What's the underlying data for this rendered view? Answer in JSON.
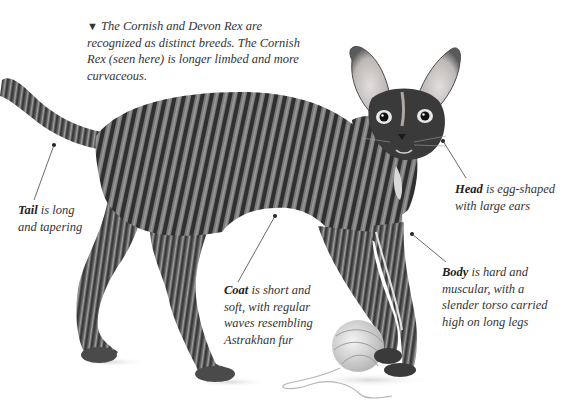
{
  "figure": {
    "intro": {
      "marker_icon": "down-triangle-icon",
      "marker_glyph": "▼",
      "lines": [
        "The Cornish and Devon Rex are",
        "recognized as distinct breeds. The Cornish",
        "Rex (seen here) is longer limbed and more",
        "curvaceous."
      ]
    },
    "callouts": {
      "tail": {
        "term": "Tail",
        "lines": [
          " is long",
          "and tapering"
        ]
      },
      "head": {
        "term": "Head",
        "lines": [
          " is egg-shaped",
          "with large ears"
        ]
      },
      "body": {
        "term": "Body",
        "lines": [
          " is hard and",
          "muscular, with a",
          "slender torso carried",
          "high on long legs"
        ]
      },
      "coat": {
        "term": "Coat",
        "lines": [
          " is short and",
          "soft, with regular",
          "waves resembling",
          "Astrakhan fur"
        ]
      }
    },
    "colors": {
      "background": "#ffffff",
      "text": "#333333",
      "fur_dark": "#2e2e2e",
      "fur_mid": "#6b6b6b",
      "fur_light": "#a9a9a9",
      "yarn": "#dcdcdc"
    }
  }
}
